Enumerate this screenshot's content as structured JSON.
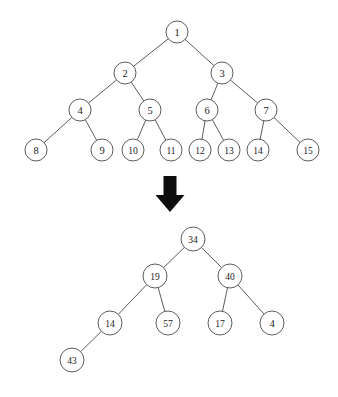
{
  "figure": {
    "background_color": "#ffffff",
    "stroke_color": "#4a4a4a",
    "text_color": "#1a1a1a",
    "arrow_color": "#0d0d0d",
    "node_radius": 11
  },
  "top_tree": {
    "name": "complete-binary-tree-indices",
    "nodes": [
      {
        "id": "n1",
        "label": "1",
        "x": 177,
        "y": 32,
        "r": 11
      },
      {
        "id": "n2",
        "label": "2",
        "x": 125,
        "y": 73,
        "r": 11
      },
      {
        "id": "n3",
        "label": "3",
        "x": 222,
        "y": 73,
        "r": 11
      },
      {
        "id": "n4",
        "label": "4",
        "x": 80,
        "y": 110,
        "r": 11
      },
      {
        "id": "n5",
        "label": "5",
        "x": 150,
        "y": 110,
        "r": 11
      },
      {
        "id": "n6",
        "label": "6",
        "x": 207,
        "y": 110,
        "r": 11
      },
      {
        "id": "n7",
        "label": "7",
        "x": 266,
        "y": 110,
        "r": 11
      },
      {
        "id": "n8",
        "label": "8",
        "x": 36,
        "y": 150,
        "r": 11
      },
      {
        "id": "n9",
        "label": "9",
        "x": 102,
        "y": 150,
        "r": 11
      },
      {
        "id": "n10",
        "label": "10",
        "x": 133,
        "y": 150,
        "r": 11
      },
      {
        "id": "n11",
        "label": "11",
        "x": 171,
        "y": 150,
        "r": 11
      },
      {
        "id": "n12",
        "label": "12",
        "x": 200,
        "y": 150,
        "r": 11
      },
      {
        "id": "n13",
        "label": "13",
        "x": 229,
        "y": 150,
        "r": 11
      },
      {
        "id": "n14",
        "label": "14",
        "x": 258,
        "y": 150,
        "r": 11
      },
      {
        "id": "n15",
        "label": "15",
        "x": 308,
        "y": 150,
        "r": 11
      }
    ],
    "edges": [
      {
        "from": "n1",
        "to": "n2"
      },
      {
        "from": "n1",
        "to": "n3"
      },
      {
        "from": "n2",
        "to": "n4"
      },
      {
        "from": "n2",
        "to": "n5"
      },
      {
        "from": "n3",
        "to": "n6"
      },
      {
        "from": "n3",
        "to": "n7"
      },
      {
        "from": "n4",
        "to": "n8"
      },
      {
        "from": "n4",
        "to": "n9"
      },
      {
        "from": "n5",
        "to": "n10"
      },
      {
        "from": "n5",
        "to": "n11"
      },
      {
        "from": "n6",
        "to": "n12"
      },
      {
        "from": "n6",
        "to": "n13"
      },
      {
        "from": "n7",
        "to": "n14"
      },
      {
        "from": "n7",
        "to": "n15"
      }
    ]
  },
  "arrow": {
    "name": "downward-arrow-icon",
    "x": 170,
    "y_top": 176,
    "y_bottom": 212,
    "shaft_width": 13,
    "head_width": 29
  },
  "bottom_tree": {
    "name": "binary-tree-values",
    "nodes": [
      {
        "id": "b34",
        "label": "34",
        "x": 193,
        "y": 239,
        "r": 12
      },
      {
        "id": "b19",
        "label": "19",
        "x": 155,
        "y": 276,
        "r": 12
      },
      {
        "id": "b40",
        "label": "40",
        "x": 230,
        "y": 276,
        "r": 12
      },
      {
        "id": "b14",
        "label": "14",
        "x": 110,
        "y": 323,
        "r": 12
      },
      {
        "id": "b57",
        "label": "57",
        "x": 168,
        "y": 323,
        "r": 12
      },
      {
        "id": "b17",
        "label": "17",
        "x": 220,
        "y": 323,
        "r": 12
      },
      {
        "id": "b4",
        "label": "4",
        "x": 272,
        "y": 323,
        "r": 12
      },
      {
        "id": "b43",
        "label": "43",
        "x": 72,
        "y": 360,
        "r": 12
      }
    ],
    "edges": [
      {
        "from": "b34",
        "to": "b19"
      },
      {
        "from": "b34",
        "to": "b40"
      },
      {
        "from": "b19",
        "to": "b14"
      },
      {
        "from": "b19",
        "to": "b57"
      },
      {
        "from": "b40",
        "to": "b17"
      },
      {
        "from": "b40",
        "to": "b4"
      },
      {
        "from": "b14",
        "to": "b43"
      }
    ]
  }
}
